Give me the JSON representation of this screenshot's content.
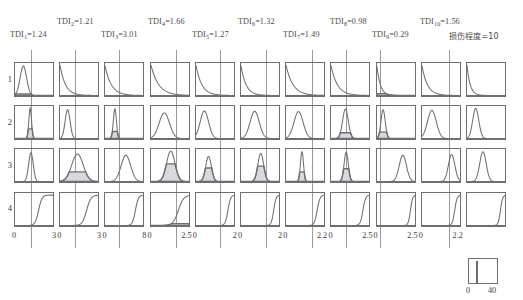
{
  "header": {
    "labels_top": [
      {
        "name": "TDI",
        "sub": "2",
        "value": "=1.21"
      },
      {
        "name": "TDI",
        "sub": "4",
        "value": "=1.66"
      },
      {
        "name": "TDI",
        "sub": "6",
        "value": "=1.32"
      },
      {
        "name": "TDI",
        "sub": "8",
        "value": "=0.98"
      },
      {
        "name": "TDI",
        "sub": "10",
        "value": "=1.56"
      }
    ],
    "labels_bottom": [
      {
        "name": "TDI",
        "sub": "1",
        "value": "=1.24"
      },
      {
        "name": "TDI",
        "sub": "3",
        "value": "=3.01"
      },
      {
        "name": "TDI",
        "sub": "5",
        "value": "=1.27"
      },
      {
        "name": "TDI",
        "sub": "7",
        "value": "=1.49"
      },
      {
        "name": "TDI",
        "sub": "9",
        "value": "=0.29"
      }
    ],
    "damage_label": "损伤程度=10"
  },
  "rows": {
    "labels": [
      "1",
      "2",
      "3",
      "4"
    ]
  },
  "axes": {
    "min_label": "0",
    "max_labels": [
      "3",
      "3",
      "8",
      "2.5",
      "2",
      "2",
      "2.2",
      "2.5",
      "2.5",
      "2.2"
    ]
  },
  "legend": {
    "min_label": "0",
    "max_label": "40"
  },
  "colors": {
    "curve": "#6f6f73",
    "fill": "#d9d9dd",
    "border": "#6f6f73",
    "refline": "#9a9aa2",
    "text": "#3a3a3a"
  },
  "chart_data": {
    "type": "line",
    "title": "",
    "xlabel": "",
    "ylabel": "",
    "grid": false,
    "legend_position": "bottom-right",
    "row_labels": [
      "1",
      "2",
      "3",
      "4"
    ],
    "column_xmax": [
      3,
      3,
      8,
      2.5,
      2,
      2,
      2.2,
      2.5,
      2.5,
      2.2,
      2.2
    ],
    "column_xmin": [
      0,
      0,
      0,
      0,
      0,
      0,
      0,
      0,
      0,
      0,
      0
    ],
    "reference_lines": [
      1.24,
      1.21,
      3.01,
      1.66,
      1.27,
      1.32,
      1.49,
      0.98,
      0.29,
      1.56
    ],
    "legend_range": [
      0,
      40
    ],
    "panels": [
      {
        "row": 1,
        "col": 1,
        "shape": "peak",
        "mu": 0.22,
        "sigma": 0.085,
        "peak": 0.92,
        "shaded": true,
        "shade_level": 0.05
      },
      {
        "row": 1,
        "col": 2,
        "shape": "decay",
        "rate": 7.0,
        "peak": 0.95,
        "shaded": false
      },
      {
        "row": 1,
        "col": 3,
        "shape": "decay",
        "rate": 6.0,
        "peak": 0.93,
        "shaded": false
      },
      {
        "row": 1,
        "col": 4,
        "shape": "decay",
        "rate": 5.0,
        "peak": 0.95,
        "shaded": false
      },
      {
        "row": 1,
        "col": 5,
        "shape": "decay",
        "rate": 6.5,
        "peak": 0.94,
        "shaded": false
      },
      {
        "row": 1,
        "col": 6,
        "shape": "decay",
        "rate": 7.5,
        "peak": 0.93,
        "shaded": false
      },
      {
        "row": 1,
        "col": 7,
        "shape": "decay",
        "rate": 5.5,
        "peak": 0.95,
        "shaded": false
      },
      {
        "row": 1,
        "col": 8,
        "shape": "decay",
        "rate": 6.0,
        "peak": 0.94,
        "shaded": false
      },
      {
        "row": 1,
        "col": 9,
        "shape": "decay",
        "rate": 11.0,
        "peak": 0.9,
        "shaded": true,
        "shade_level": 0.06
      },
      {
        "row": 1,
        "col": 10,
        "shape": "decay",
        "rate": 7.0,
        "peak": 0.93,
        "shaded": false
      },
      {
        "row": 1,
        "col": 11,
        "shape": "decay",
        "rate": 12.0,
        "peak": 0.95,
        "shaded": false
      },
      {
        "row": 2,
        "col": 1,
        "shape": "peak",
        "mu": 0.4,
        "sigma": 0.035,
        "peak": 0.95,
        "shaded": true,
        "shade_level": 0.3
      },
      {
        "row": 2,
        "col": 2,
        "shape": "peak",
        "mu": 0.2,
        "sigma": 0.065,
        "peak": 0.9,
        "shaded": false
      },
      {
        "row": 2,
        "col": 3,
        "shape": "peak",
        "mu": 0.26,
        "sigma": 0.04,
        "peak": 0.93,
        "shaded": true,
        "shade_level": 0.22
      },
      {
        "row": 2,
        "col": 4,
        "shape": "peak",
        "mu": 0.35,
        "sigma": 0.135,
        "peak": 0.8,
        "shaded": false
      },
      {
        "row": 2,
        "col": 5,
        "shape": "peak",
        "mu": 0.22,
        "sigma": 0.11,
        "peak": 0.86,
        "shaded": false
      },
      {
        "row": 2,
        "col": 6,
        "shape": "peak",
        "mu": 0.36,
        "sigma": 0.12,
        "peak": 0.85,
        "shaded": false
      },
      {
        "row": 2,
        "col": 7,
        "shape": "peak",
        "mu": 0.33,
        "sigma": 0.12,
        "peak": 0.84,
        "shaded": false
      },
      {
        "row": 2,
        "col": 8,
        "shape": "peak",
        "mu": 0.38,
        "sigma": 0.075,
        "peak": 0.92,
        "shaded": true,
        "shade_level": 0.18
      },
      {
        "row": 2,
        "col": 9,
        "shape": "peak",
        "mu": 0.16,
        "sigma": 0.055,
        "peak": 0.9,
        "shaded": true,
        "shade_level": 0.2
      },
      {
        "row": 2,
        "col": 10,
        "shape": "peak",
        "mu": 0.26,
        "sigma": 0.115,
        "peak": 0.88,
        "shaded": false
      },
      {
        "row": 2,
        "col": 11,
        "shape": "peak",
        "mu": 0.23,
        "sigma": 0.08,
        "peak": 0.94,
        "shaded": false
      },
      {
        "row": 3,
        "col": 1,
        "shape": "peak",
        "mu": 0.42,
        "sigma": 0.06,
        "peak": 0.9,
        "shaded": false
      },
      {
        "row": 3,
        "col": 2,
        "shape": "peak",
        "mu": 0.46,
        "sigma": 0.15,
        "peak": 0.86,
        "shaded": true,
        "shade_level": 0.3
      },
      {
        "row": 3,
        "col": 3,
        "shape": "peak",
        "mu": 0.55,
        "sigma": 0.125,
        "peak": 0.82,
        "shaded": false
      },
      {
        "row": 3,
        "col": 4,
        "shape": "peak",
        "mu": 0.52,
        "sigma": 0.11,
        "peak": 0.95,
        "shaded": true,
        "shade_level": 0.55
      },
      {
        "row": 3,
        "col": 5,
        "shape": "peak",
        "mu": 0.33,
        "sigma": 0.075,
        "peak": 0.78,
        "shaded": true,
        "shade_level": 0.42
      },
      {
        "row": 3,
        "col": 6,
        "shape": "peak",
        "mu": 0.52,
        "sigma": 0.075,
        "peak": 0.88,
        "shaded": true,
        "shade_level": 0.48
      },
      {
        "row": 3,
        "col": 7,
        "shape": "peak",
        "mu": 0.42,
        "sigma": 0.04,
        "peak": 0.93,
        "shaded": true,
        "shade_level": 0.3
      },
      {
        "row": 3,
        "col": 8,
        "shape": "peak",
        "mu": 0.4,
        "sigma": 0.055,
        "peak": 0.92,
        "shaded": true,
        "shade_level": 0.4
      },
      {
        "row": 3,
        "col": 9,
        "shape": "peak",
        "mu": 0.68,
        "sigma": 0.095,
        "peak": 0.82,
        "shaded": false
      },
      {
        "row": 3,
        "col": 10,
        "shape": "peak",
        "mu": 0.78,
        "sigma": 0.085,
        "peak": 0.84,
        "shaded": false
      },
      {
        "row": 3,
        "col": 11,
        "shape": "peak",
        "mu": 0.42,
        "sigma": 0.085,
        "peak": 0.93,
        "shaded": false
      },
      {
        "row": 4,
        "col": 1,
        "shape": "ramp",
        "knee": 0.62,
        "steep": 7.0,
        "peak": 0.95,
        "shaded": false
      },
      {
        "row": 4,
        "col": 2,
        "shape": "ramp",
        "knee": 0.7,
        "steep": 5.5,
        "peak": 0.95,
        "shaded": false
      },
      {
        "row": 4,
        "col": 3,
        "shape": "ramp",
        "knee": 0.8,
        "steep": 8.0,
        "peak": 0.95,
        "shaded": false
      },
      {
        "row": 4,
        "col": 4,
        "shape": "ramp",
        "knee": 0.72,
        "steep": 4.5,
        "peak": 0.95,
        "shaded": true,
        "shade_level": 0.06
      },
      {
        "row": 4,
        "col": 5,
        "shape": "ramp",
        "knee": 0.84,
        "steep": 9.0,
        "peak": 0.95,
        "shaded": false
      },
      {
        "row": 4,
        "col": 6,
        "shape": "ramp",
        "knee": 0.86,
        "steep": 10.0,
        "peak": 0.95,
        "shaded": false
      },
      {
        "row": 4,
        "col": 7,
        "shape": "ramp",
        "knee": 0.82,
        "steep": 8.5,
        "peak": 0.95,
        "shaded": false
      },
      {
        "row": 4,
        "col": 8,
        "shape": "ramp",
        "knee": 0.84,
        "steep": 9.0,
        "peak": 0.95,
        "shaded": false
      },
      {
        "row": 4,
        "col": 9,
        "shape": "ramp",
        "knee": 0.88,
        "steep": 11.0,
        "peak": 0.95,
        "shaded": false
      },
      {
        "row": 4,
        "col": 10,
        "shape": "ramp",
        "knee": 0.86,
        "steep": 10.0,
        "peak": 0.95,
        "shaded": false
      },
      {
        "row": 4,
        "col": 11,
        "shape": "ramp",
        "knee": 0.88,
        "steep": 11.0,
        "peak": 0.95,
        "shaded": false
      }
    ]
  }
}
